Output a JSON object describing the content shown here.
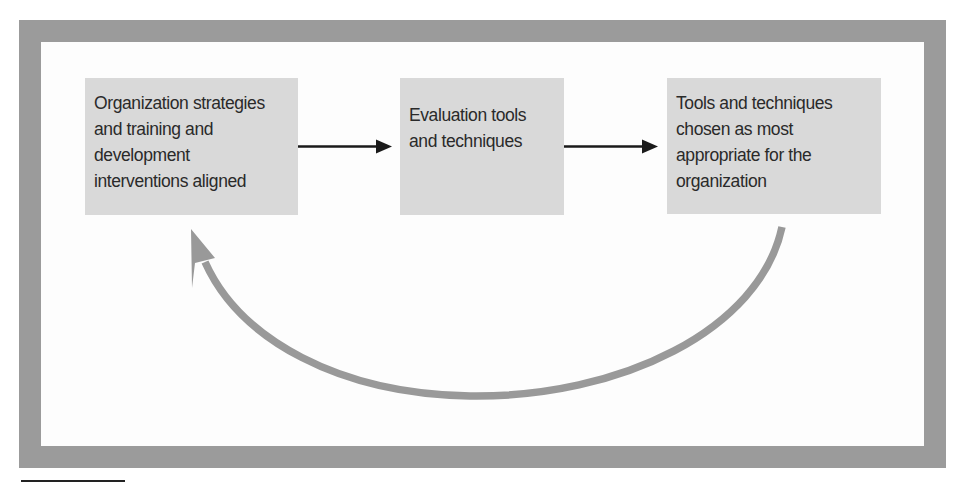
{
  "diagram": {
    "type": "cycle-flow",
    "frame_color": "#9b9b9b",
    "box_fill": "#d9d9d9",
    "text_color": "#2a2a2a",
    "arrow_color": "#1a1a1a",
    "feedback_arrow_color": "#999999",
    "boxes": [
      {
        "id": "box1",
        "lines": [
          "Organization strategies",
          "and training and",
          "development",
          "interventions aligned"
        ]
      },
      {
        "id": "box2",
        "lines": [
          "Evaluation tools",
          "and techniques"
        ]
      },
      {
        "id": "box3",
        "lines": [
          "Tools and techniques",
          "chosen as most",
          "appropriate for the",
          "organization"
        ]
      }
    ],
    "edges": [
      {
        "from": "box1",
        "to": "box2",
        "style": "straight-arrow"
      },
      {
        "from": "box2",
        "to": "box3",
        "style": "straight-arrow"
      },
      {
        "from": "box3",
        "to": "box1",
        "style": "curved-feedback-arrow"
      }
    ]
  }
}
